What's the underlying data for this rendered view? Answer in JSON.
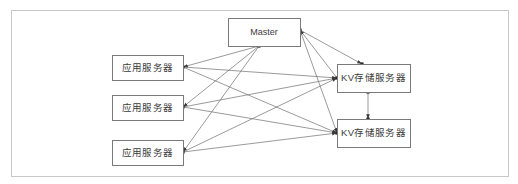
{
  "diagram": {
    "canvas": {
      "width": 518,
      "height": 184,
      "background": "#ffffff"
    },
    "frame": {
      "name": "diagram-frame",
      "x": 11,
      "y": 10,
      "width": 497,
      "height": 166,
      "stroke": "#c8c8c8"
    },
    "colors": {
      "node_stroke": "#7a7a7a",
      "node_fill": "#ffffff",
      "edge": "#6e6e6e",
      "text": "#3b3b3b",
      "frame_stroke": "#c8c8c8",
      "port": "#2b2b2b"
    },
    "nodes": [
      {
        "id": "master",
        "label": "Master",
        "role": "master-node",
        "x": 228,
        "y": 18,
        "width": 72,
        "height": 28,
        "cx": 264,
        "cy": 32
      },
      {
        "id": "app1",
        "label": "应用服务器",
        "role": "application-server",
        "x": 112,
        "y": 55,
        "width": 71,
        "height": 25,
        "cx": 147.5,
        "cy": 67.5
      },
      {
        "id": "app2",
        "label": "应用服务器",
        "role": "application-server",
        "x": 112,
        "y": 95,
        "width": 71,
        "height": 25,
        "cx": 147.5,
        "cy": 107.5
      },
      {
        "id": "app3",
        "label": "应用服务器",
        "role": "application-server",
        "x": 112,
        "y": 140,
        "width": 71,
        "height": 25,
        "cx": 147.5,
        "cy": 152.5
      },
      {
        "id": "kv1",
        "label": "KV存储服务器",
        "role": "kv-storage-server",
        "x": 337,
        "y": 64,
        "width": 73,
        "height": 28,
        "cx": 373.5,
        "cy": 78
      },
      {
        "id": "kv2",
        "label": "KV存储服务器",
        "role": "kv-storage-server",
        "x": 337,
        "y": 119,
        "width": 73,
        "height": 28,
        "cx": 373.5,
        "cy": 133
      }
    ],
    "ports": [
      {
        "id": "master-bottom",
        "x": 259,
        "y": 46
      },
      {
        "id": "master-right",
        "x": 300,
        "y": 30
      },
      {
        "id": "app1-right",
        "x": 183,
        "y": 67
      },
      {
        "id": "app2-right",
        "x": 183,
        "y": 107
      },
      {
        "id": "app3-right",
        "x": 183,
        "y": 152
      },
      {
        "id": "kv1-left",
        "x": 337,
        "y": 78
      },
      {
        "id": "kv1-top",
        "x": 362,
        "y": 64
      },
      {
        "id": "kv1-bottom",
        "x": 368,
        "y": 92
      },
      {
        "id": "kv2-left",
        "x": 337,
        "y": 133
      },
      {
        "id": "kv2-top",
        "x": 368,
        "y": 119
      }
    ],
    "edges": [
      {
        "id": "master-to-app1",
        "from": "master-bottom",
        "to": "app1-right",
        "arrow_at": "to"
      },
      {
        "id": "master-to-app2",
        "from": "master-bottom",
        "to": "app2-right",
        "arrow_at": "to"
      },
      {
        "id": "master-to-app3",
        "from": "master-bottom",
        "to": "app3-right",
        "arrow_at": "to"
      },
      {
        "id": "app1-to-kv1",
        "from": "app1-right",
        "to": "kv1-left",
        "arrow_at": "to"
      },
      {
        "id": "app1-to-kv2",
        "from": "app1-right",
        "to": "kv2-left",
        "arrow_at": "to"
      },
      {
        "id": "app2-to-kv1",
        "from": "app2-right",
        "to": "kv1-left",
        "arrow_at": "to"
      },
      {
        "id": "app2-to-kv2",
        "from": "app2-right",
        "to": "kv2-left",
        "arrow_at": "to"
      },
      {
        "id": "app3-to-kv1",
        "from": "app3-right",
        "to": "kv1-left",
        "arrow_at": "to"
      },
      {
        "id": "app3-to-kv2",
        "from": "app3-right",
        "to": "kv2-left",
        "arrow_at": "to"
      },
      {
        "id": "kv1-to-master",
        "from": "kv1-left",
        "to": "master-right",
        "arrow_at": "to"
      },
      {
        "id": "master-to-kv1",
        "from": "master-right",
        "to": "kv1-top",
        "arrow_at": "to"
      },
      {
        "id": "master-to-kv2",
        "from": "master-right",
        "to": "kv2-left",
        "arrow_at": "to"
      },
      {
        "id": "kv1-to-kv2",
        "from": "kv1-bottom",
        "to": "kv2-top",
        "arrow_at": "to"
      }
    ]
  }
}
